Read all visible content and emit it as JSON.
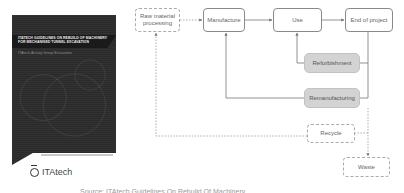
{
  "cover": {
    "title": "ITAtech Guidelines On Rebuild Of Machinery For Mechanised Tunnel Excavation",
    "subtitle": "ITAtech Activity Group Excavation",
    "logo_text": "ITAtech",
    "logo_icon": "itatech-logo-icon"
  },
  "diagram": {
    "nodes": {
      "raw_material": "Raw material processing",
      "manufacture": "Manufacture",
      "use": "Use",
      "end_of_project": "End of project",
      "refurbishment": "Refurbishment",
      "remanufacturing": "Remanufacturing",
      "recycle": "Recycle",
      "waste": "Waste"
    },
    "colors": {
      "solid_border": "#8a8a8a",
      "dashed_border": "#aaaaaa",
      "highlight_fill": "#d3d3d3",
      "arrow": "#777777"
    }
  },
  "caption": "Source: ITAtech Guidelines On Rebuild Of Machinery"
}
